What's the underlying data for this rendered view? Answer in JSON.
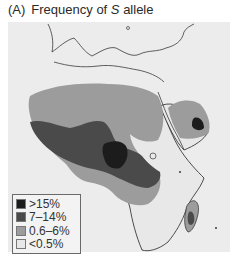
{
  "title": {
    "panel_label": "(A)",
    "text_prefix": "Frequency of ",
    "text_italic": "S",
    "text_suffix": " allele"
  },
  "map": {
    "region": "Africa, Southern Europe and Middle East",
    "colors": {
      "background": "#ececec",
      "outline": "#3a3a3a",
      "level_high": "#1c1c1c",
      "level_mid": "#4a4a4a",
      "level_low": "#9c9c9c",
      "level_none": "#e8e8e8"
    }
  },
  "legend": {
    "items": [
      {
        "label": ">15%",
        "color": "#1c1c1c"
      },
      {
        "label": "7–14%",
        "color": "#4a4a4a"
      },
      {
        "label": "0.6–6%",
        "color": "#9c9c9c"
      },
      {
        "label": "<0.5%",
        "color": "#e8e8e8"
      }
    ]
  }
}
